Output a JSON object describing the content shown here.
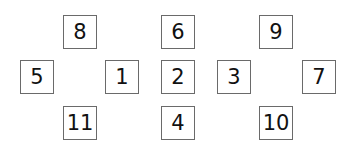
{
  "diagram": {
    "type": "numbered-box-grid",
    "boxes": [
      {
        "label": "8",
        "x": 63,
        "y": 15
      },
      {
        "label": "6",
        "x": 161,
        "y": 15
      },
      {
        "label": "9",
        "x": 259,
        "y": 15
      },
      {
        "label": "5",
        "x": 20,
        "y": 60
      },
      {
        "label": "1",
        "x": 105,
        "y": 60
      },
      {
        "label": "2",
        "x": 161,
        "y": 60
      },
      {
        "label": "3",
        "x": 217,
        "y": 60
      },
      {
        "label": "7",
        "x": 302,
        "y": 60
      },
      {
        "label": "11",
        "x": 63,
        "y": 106
      },
      {
        "label": "4",
        "x": 161,
        "y": 106
      },
      {
        "label": "10",
        "x": 259,
        "y": 106
      }
    ]
  }
}
